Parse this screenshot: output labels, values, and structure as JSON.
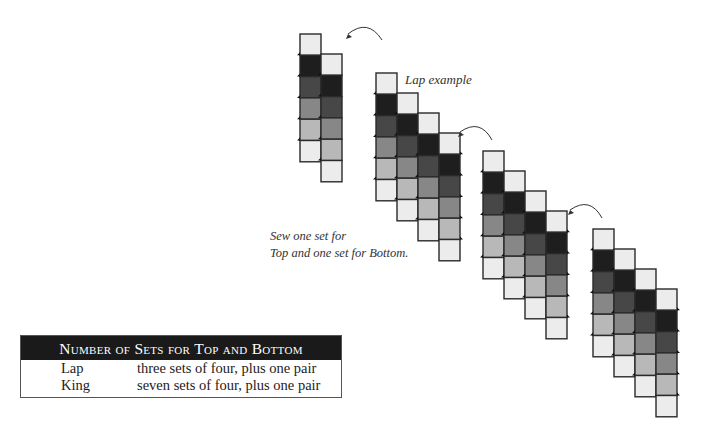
{
  "captions": {
    "lap_example": "Lap example",
    "sew_line1": "Sew one set for",
    "sew_line2": "Top and one set for Bottom."
  },
  "colors": {
    "pale": "#ececec",
    "black": "#1e1e1e",
    "dark": "#474747",
    "mid": "#878787",
    "light": "#b8b8b8",
    "outline": "#2a2a2a",
    "arrow": "#333333"
  },
  "strip_sequence": [
    "pale",
    "black",
    "dark",
    "mid",
    "light",
    "pale"
  ],
  "diagram": {
    "groups": [
      {
        "name": "pair",
        "columns": 2
      },
      {
        "name": "set-of-four-1",
        "columns": 4
      },
      {
        "name": "set-of-four-2",
        "columns": 4
      },
      {
        "name": "set-of-four-3",
        "columns": 4
      }
    ]
  },
  "table": {
    "title": "Number of Sets for Top and Bottom",
    "rows": [
      {
        "size": "Lap",
        "description": "three sets of four, plus one pair"
      },
      {
        "size": "King",
        "description": "seven sets of four, plus one pair"
      }
    ]
  }
}
